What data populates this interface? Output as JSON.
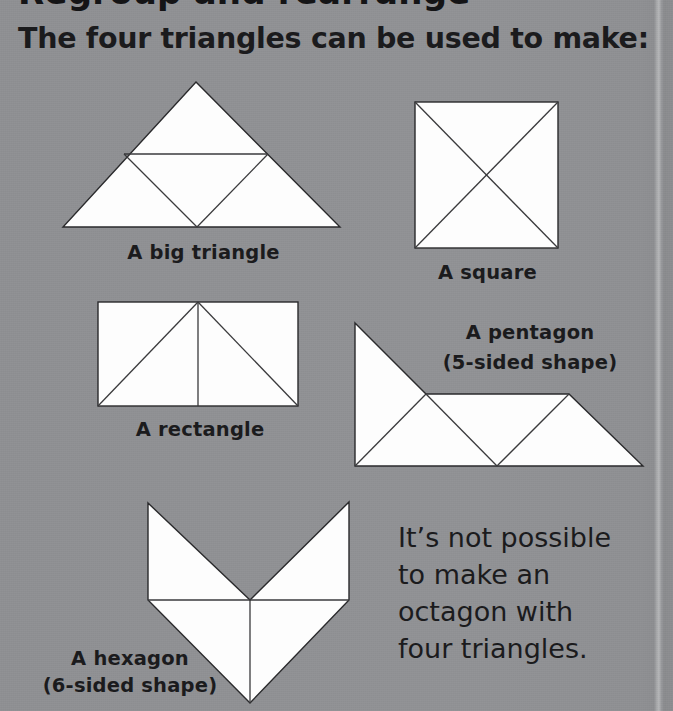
{
  "page": {
    "background_color": "#919295",
    "shape_fill_color": "#fdfdfd",
    "shape_stroke_color": "#2a2a2c",
    "text_color": "#1b1b1d",
    "cropped_title_text": "Regroup and rearrange",
    "heading": "The four triangles can be used to make:"
  },
  "figures": [
    {
      "id": "big-triangle",
      "label": "A big triangle",
      "label_line2": ""
    },
    {
      "id": "square",
      "label": "A square",
      "label_line2": ""
    },
    {
      "id": "rectangle",
      "label": "A rectangle",
      "label_line2": ""
    },
    {
      "id": "pentagon",
      "label": "A pentagon",
      "label_line2": "(5-sided shape)"
    },
    {
      "id": "hexagon",
      "label": "A hexagon",
      "label_line2": "(6-sided shape)"
    }
  ],
  "note": {
    "line1": "It’s not possible",
    "line2": "to make an",
    "line3": "octagon with",
    "line4": "four triangles."
  }
}
